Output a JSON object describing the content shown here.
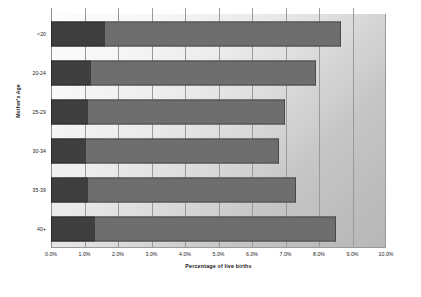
{
  "chart_data": {
    "type": "bar",
    "orientation": "horizontal",
    "stacked": true,
    "title": "",
    "xlabel": "Percentage of live births",
    "ylabel": "Mother's Age",
    "categories": [
      "<20",
      "20-24",
      "25-29",
      "30-34",
      "35-39",
      "40+"
    ],
    "series": [
      {
        "name": "segment-1",
        "color": "#3f3f3f",
        "values": [
          1.6,
          1.2,
          1.1,
          1.05,
          1.1,
          1.3
        ]
      },
      {
        "name": "segment-2",
        "color": "#6e6e6e",
        "values": [
          7.05,
          6.7,
          5.9,
          5.75,
          6.2,
          7.2
        ]
      }
    ],
    "totals": [
      8.65,
      7.9,
      7.0,
      6.8,
      7.3,
      8.5
    ],
    "xlim": [
      0.0,
      10.0
    ],
    "xtick_values": [
      0.0,
      1.0,
      2.0,
      3.0,
      4.0,
      5.0,
      6.0,
      7.0,
      8.0,
      9.0,
      10.0
    ],
    "xtick_labels": [
      "0.0%",
      "1.0%",
      "2.0%",
      "3.0%",
      "4.0%",
      "5.0%",
      "6.0%",
      "7.0%",
      "8.0%",
      "9.0%",
      "10.0%"
    ],
    "grid": "vertical",
    "legend": "none"
  }
}
